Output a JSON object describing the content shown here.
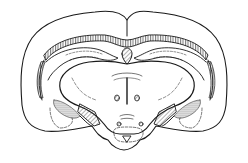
{
  "figure": {
    "type": "line-drawing",
    "background": "#ffffff",
    "stroke_color": "#1a1a1a",
    "labels": []
  }
}
